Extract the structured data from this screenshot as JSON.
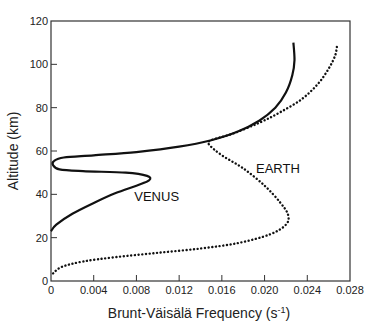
{
  "chart_data": {
    "type": "line",
    "title": "",
    "xlabel": "Brunt-Väisälä Frequency (s⁻¹)",
    "xlabel_display": "Brunt-Väisälä Frequency (s",
    "xlabel_sup": "-1",
    "xlabel_close": ")",
    "ylabel": "Altitude (km)",
    "xlim": [
      0,
      0.028
    ],
    "ylim": [
      0,
      120
    ],
    "xticks": [
      0,
      0.004,
      0.008,
      0.012,
      0.016,
      0.02,
      0.024,
      0.028
    ],
    "xtick_labels": [
      "0",
      "0.004",
      "0.008",
      "0.012",
      "0.016",
      "0.020",
      "0.024",
      "0.028"
    ],
    "yticks": [
      0,
      20,
      40,
      60,
      80,
      100,
      120
    ],
    "ytick_labels": [
      "0",
      "20",
      "40",
      "60",
      "80",
      "100",
      "120"
    ],
    "grid": false,
    "series": [
      {
        "name": "VENUS",
        "style": "solid",
        "points": [
          [
            0.0,
            23
          ],
          [
            0.0005,
            26
          ],
          [
            0.002,
            31
          ],
          [
            0.004,
            36
          ],
          [
            0.006,
            40.5
          ],
          [
            0.008,
            44
          ],
          [
            0.0092,
            46.5
          ],
          [
            0.009,
            48.5
          ],
          [
            0.007,
            50
          ],
          [
            0.003,
            50.7
          ],
          [
            0.0008,
            51.5
          ],
          [
            0.0002,
            53.5
          ],
          [
            0.0003,
            55.5
          ],
          [
            0.0012,
            57
          ],
          [
            0.004,
            58
          ],
          [
            0.008,
            59.5
          ],
          [
            0.012,
            62
          ],
          [
            0.015,
            65
          ],
          [
            0.0175,
            69
          ],
          [
            0.0195,
            74
          ],
          [
            0.021,
            80
          ],
          [
            0.022,
            87
          ],
          [
            0.0226,
            95
          ],
          [
            0.0228,
            102
          ],
          [
            0.0227,
            110
          ]
        ]
      },
      {
        "name": "EARTH",
        "style": "dotted",
        "points": [
          [
            0.0002,
            3.5
          ],
          [
            0.001,
            6.5
          ],
          [
            0.003,
            9
          ],
          [
            0.006,
            11
          ],
          [
            0.01,
            13
          ],
          [
            0.014,
            15
          ],
          [
            0.0175,
            17.5
          ],
          [
            0.0205,
            21.5
          ],
          [
            0.022,
            26
          ],
          [
            0.0222,
            30.5
          ],
          [
            0.0215,
            36
          ],
          [
            0.02,
            44
          ],
          [
            0.018,
            52
          ],
          [
            0.016,
            58
          ],
          [
            0.0148,
            63
          ],
          [
            0.015,
            65
          ],
          [
            0.017,
            68
          ],
          [
            0.0195,
            73
          ],
          [
            0.0215,
            78
          ],
          [
            0.0235,
            84
          ],
          [
            0.025,
            91
          ],
          [
            0.026,
            98
          ],
          [
            0.0266,
            104
          ],
          [
            0.0268,
            109
          ]
        ]
      }
    ],
    "annotations": [
      {
        "text": "VENUS",
        "x": 0.0078,
        "y": 37
      },
      {
        "text": "EARTH",
        "x": 0.0192,
        "y": 50
      }
    ]
  }
}
